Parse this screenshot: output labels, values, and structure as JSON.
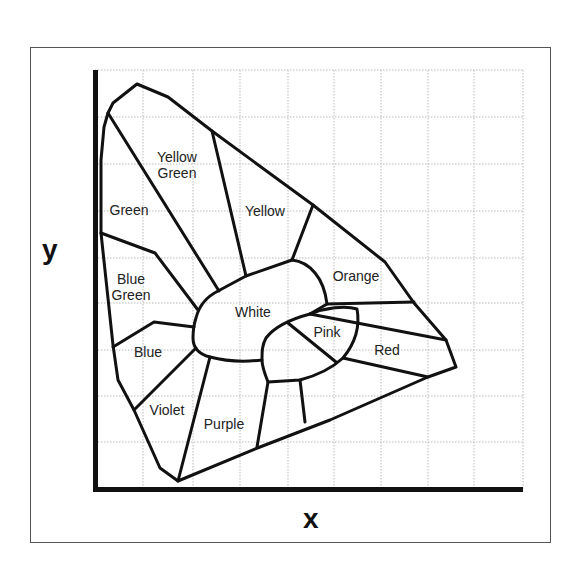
{
  "diagram": {
    "type": "chromaticity-regions",
    "axes": {
      "x_label": "x",
      "y_label": "y"
    },
    "grid": {
      "vertical_x": [
        143,
        193,
        240,
        288,
        334,
        381,
        428,
        474,
        523
      ],
      "horizontal_y": [
        70,
        117,
        164,
        211,
        258,
        303,
        350,
        396,
        442
      ],
      "color": "#bbbbbb"
    },
    "regions": [
      {
        "id": "yellow-green",
        "label": "Yellow\nGreen",
        "x": 177,
        "y": 165
      },
      {
        "id": "green",
        "label": "Green",
        "x": 129,
        "y": 210
      },
      {
        "id": "yellow",
        "label": "Yellow",
        "x": 265,
        "y": 211
      },
      {
        "id": "blue-green",
        "label": "Blue\nGreen",
        "x": 131,
        "y": 287
      },
      {
        "id": "orange",
        "label": "Orange",
        "x": 356,
        "y": 276
      },
      {
        "id": "white",
        "label": "White",
        "x": 253,
        "y": 312
      },
      {
        "id": "pink",
        "label": "Pink",
        "x": 327,
        "y": 332
      },
      {
        "id": "red",
        "label": "Red",
        "x": 387,
        "y": 350
      },
      {
        "id": "blue",
        "label": "Blue",
        "x": 148,
        "y": 352
      },
      {
        "id": "violet",
        "label": "Violet",
        "x": 167,
        "y": 410
      },
      {
        "id": "purple",
        "label": "Purple",
        "x": 224,
        "y": 424
      }
    ],
    "colors": {
      "line": "#111111",
      "axis": "#111111",
      "frame": "#555555",
      "background": "#ffffff"
    }
  }
}
